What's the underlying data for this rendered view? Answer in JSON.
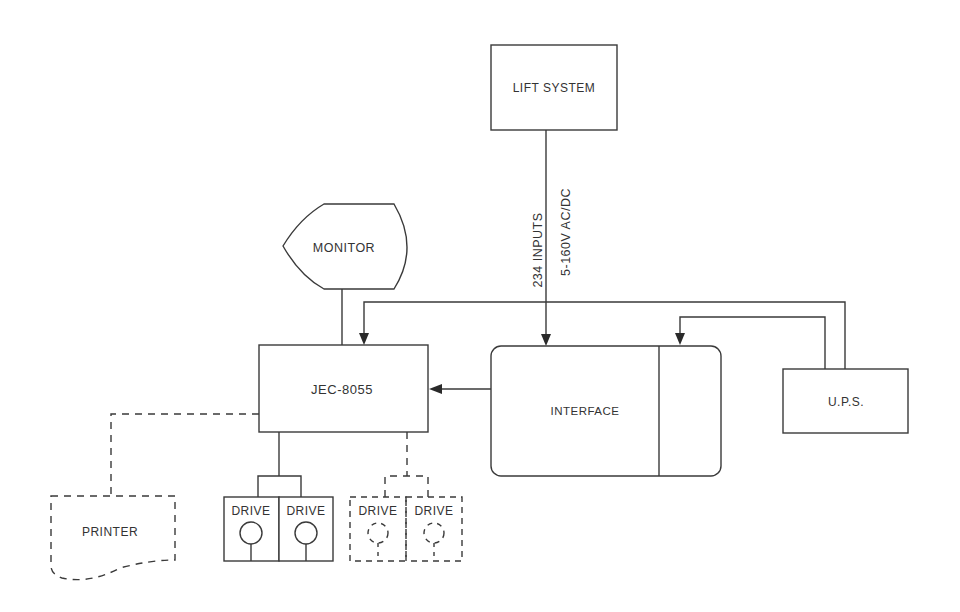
{
  "diagram": {
    "nodes": {
      "lift_system": {
        "label": "LIFT SYSTEM"
      },
      "monitor": {
        "label": "MONITOR"
      },
      "controller": {
        "label": "JEC-8055"
      },
      "interface": {
        "label": "INTERFACE"
      },
      "ups": {
        "label": "U.P.S."
      },
      "printer": {
        "label": "PRINTER",
        "optional": true
      },
      "drives": [
        {
          "label": "DRIVE",
          "optional": false
        },
        {
          "label": "DRIVE",
          "optional": false
        },
        {
          "label": "DRIVE",
          "optional": true
        },
        {
          "label": "DRIVE",
          "optional": true
        }
      ]
    },
    "edge_labels": {
      "inputs": "234 INPUTS",
      "voltage": "5-160V AC/DC"
    },
    "edges": [
      {
        "from": "lift_system",
        "to": "interface",
        "arrow": true
      },
      {
        "from": "interface",
        "to": "controller",
        "arrow": true
      },
      {
        "from": "ups",
        "to": "controller",
        "arrow": true
      },
      {
        "from": "ups",
        "to": "interface",
        "arrow": true
      },
      {
        "from": "monitor",
        "to": "controller",
        "arrow": false
      },
      {
        "from": "controller",
        "to": "printer",
        "arrow": false,
        "dashed": true
      },
      {
        "from": "controller",
        "to": "drives.0-1",
        "arrow": false
      },
      {
        "from": "controller",
        "to": "drives.2-3",
        "arrow": false,
        "dashed": true
      }
    ],
    "colors": {
      "line": "#3a3a3a",
      "text": "#333333",
      "background": "#ffffff"
    }
  }
}
